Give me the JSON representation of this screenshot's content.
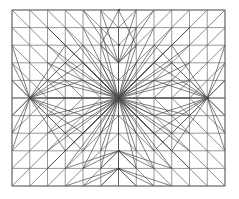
{
  "figure": {
    "kind": "mesh-diagram",
    "background_color": "#ffffff",
    "canvas": {
      "width": 239,
      "height": 199
    }
  },
  "chart_data": {
    "type": "mesh",
    "title": "",
    "xlabel": "",
    "ylabel": "",
    "grid": true,
    "legend": false,
    "domain": {
      "x0": 12,
      "y0": 10,
      "x1": 225,
      "y1": 186,
      "width": 213,
      "height": 176
    },
    "grid_structure": {
      "columns": 12,
      "rows": 10,
      "cell_width": 17.75,
      "cell_height": 17.6
    },
    "element_type": "triangle",
    "diagonal_pattern": "mirrored-toward-singularities",
    "singularity_nodes": [
      {
        "name": "center",
        "x": 119,
        "y": 98,
        "fan_rays": 16
      },
      {
        "name": "left-mid",
        "x": 30,
        "y": 98,
        "fan_rays": 12
      },
      {
        "name": "right-mid",
        "x": 208,
        "y": 98,
        "fan_rays": 12
      },
      {
        "name": "top-center-upper",
        "x": 119,
        "y": 10,
        "fan_rays": 6
      },
      {
        "name": "top-center-lower",
        "x": 119,
        "y": 45,
        "fan_rays": 8
      },
      {
        "name": "bottom-center-upper",
        "x": 119,
        "y": 151,
        "fan_rays": 10
      },
      {
        "name": "bottom-center-lower",
        "x": 119,
        "y": 169,
        "fan_rays": 10
      }
    ],
    "colors": {
      "grid_line": "#7d7d7d",
      "diagonal_line": "#5a5a5a",
      "fan_line": "#4a4a4a",
      "border": "#6f6f6f",
      "node": "#3a3a3a",
      "background": "#ffffff"
    }
  }
}
